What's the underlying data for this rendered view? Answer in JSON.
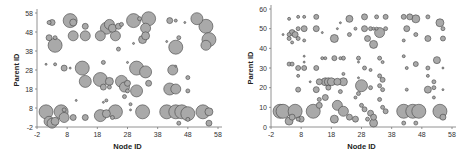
{
  "chart_data": [
    {
      "type": "scatter",
      "title": "",
      "xlabel": "Node ID",
      "ylabel": "Parent ID",
      "xlim": [
        -2,
        58
      ],
      "ylim": [
        -2,
        58
      ],
      "xticks": [
        "-2",
        "8",
        "18",
        "28",
        "38",
        "48",
        "58"
      ],
      "yticks": [
        "-2",
        "8",
        "18",
        "28",
        "38",
        "48",
        "58"
      ],
      "grid": false,
      "legend": null,
      "marker": "bubble",
      "points": [
        {
          "x": 1,
          "y": 6,
          "r": 7
        },
        {
          "x": 2,
          "y": 1,
          "r": 5
        },
        {
          "x": 3,
          "y": 0,
          "r": 5
        },
        {
          "x": 4,
          "y": 1,
          "r": 4
        },
        {
          "x": 6,
          "y": 6,
          "r": 7
        },
        {
          "x": 7,
          "y": 3,
          "r": 5
        },
        {
          "x": 7,
          "y": 7,
          "r": 2
        },
        {
          "x": 2,
          "y": 53,
          "r": 2
        },
        {
          "x": 3,
          "y": 53,
          "r": 3
        },
        {
          "x": 2,
          "y": 45,
          "r": 3
        },
        {
          "x": 4,
          "y": 45,
          "r": 2
        },
        {
          "x": 4,
          "y": 41,
          "r": 7
        },
        {
          "x": 1,
          "y": 31,
          "r": 1
        },
        {
          "x": 4,
          "y": 31,
          "r": 1.5
        },
        {
          "x": 7,
          "y": 29,
          "r": 3
        },
        {
          "x": 9,
          "y": 29,
          "r": 1
        },
        {
          "x": 9,
          "y": 54,
          "r": 7
        },
        {
          "x": 10,
          "y": 53,
          "r": 3.5
        },
        {
          "x": 10,
          "y": 46,
          "r": 5
        },
        {
          "x": 14,
          "y": 46,
          "r": 5
        },
        {
          "x": 14,
          "y": 51,
          "r": 3
        },
        {
          "x": 10,
          "y": 3,
          "r": 3
        },
        {
          "x": 14,
          "y": 3,
          "r": 3
        },
        {
          "x": 11,
          "y": 12,
          "r": 1
        },
        {
          "x": 13,
          "y": 29,
          "r": 7
        },
        {
          "x": 14,
          "y": 22,
          "r": 6
        },
        {
          "x": 19,
          "y": 23,
          "r": 7
        },
        {
          "x": 20,
          "y": 19,
          "r": 3
        },
        {
          "x": 20,
          "y": 32,
          "r": 2
        },
        {
          "x": 22,
          "y": 22,
          "r": 4
        },
        {
          "x": 22,
          "y": 19,
          "r": 2
        },
        {
          "x": 19,
          "y": 4,
          "r": 6
        },
        {
          "x": 21,
          "y": 5,
          "r": 4
        },
        {
          "x": 24,
          "y": 6,
          "r": 7
        },
        {
          "x": 23,
          "y": 3,
          "r": 2
        },
        {
          "x": 20,
          "y": 11,
          "r": 1
        },
        {
          "x": 21,
          "y": 12,
          "r": 1.5
        },
        {
          "x": 19,
          "y": 46,
          "r": 5
        },
        {
          "x": 21,
          "y": 50,
          "r": 6
        },
        {
          "x": 22,
          "y": 52,
          "r": 5
        },
        {
          "x": 23,
          "y": 50,
          "r": 4
        },
        {
          "x": 24,
          "y": 46,
          "r": 5
        },
        {
          "x": 25,
          "y": 51,
          "r": 3
        },
        {
          "x": 26,
          "y": 52,
          "r": 2
        },
        {
          "x": 25,
          "y": 39,
          "r": 2
        },
        {
          "x": 26,
          "y": 22,
          "r": 6
        },
        {
          "x": 27,
          "y": 19,
          "r": 5
        },
        {
          "x": 28,
          "y": 21,
          "r": 3
        },
        {
          "x": 27,
          "y": 14,
          "r": 2
        },
        {
          "x": 28,
          "y": 17,
          "r": 2
        },
        {
          "x": 29,
          "y": 10,
          "r": 1.5
        },
        {
          "x": 28,
          "y": 32,
          "r": 1
        },
        {
          "x": 31,
          "y": 29,
          "r": 7
        },
        {
          "x": 34,
          "y": 27,
          "r": 6
        },
        {
          "x": 31,
          "y": 17,
          "r": 6
        },
        {
          "x": 35,
          "y": 21,
          "r": 3
        },
        {
          "x": 33,
          "y": 6,
          "r": 7
        },
        {
          "x": 29,
          "y": 7,
          "r": 1
        },
        {
          "x": 30,
          "y": 54,
          "r": 7
        },
        {
          "x": 32,
          "y": 55,
          "r": 2
        },
        {
          "x": 34,
          "y": 50,
          "r": 5
        },
        {
          "x": 35,
          "y": 55,
          "r": 7
        },
        {
          "x": 33,
          "y": 44,
          "r": 4
        },
        {
          "x": 34,
          "y": 46,
          "r": 4
        },
        {
          "x": 30,
          "y": 42,
          "r": 1
        },
        {
          "x": 42,
          "y": 54,
          "r": 3
        },
        {
          "x": 44,
          "y": 54,
          "r": 1.5
        },
        {
          "x": 41,
          "y": 43,
          "r": 1
        },
        {
          "x": 44,
          "y": 40,
          "r": 7
        },
        {
          "x": 45,
          "y": 45,
          "r": 2
        },
        {
          "x": 47,
          "y": 53,
          "r": 1
        },
        {
          "x": 43,
          "y": 28,
          "r": 5
        },
        {
          "x": 44,
          "y": 30,
          "r": 1
        },
        {
          "x": 42,
          "y": 18,
          "r": 6
        },
        {
          "x": 44,
          "y": 18,
          "r": 5
        },
        {
          "x": 48,
          "y": 24,
          "r": 2
        },
        {
          "x": 48,
          "y": 17,
          "r": 2
        },
        {
          "x": 41,
          "y": 6,
          "r": 7
        },
        {
          "x": 44,
          "y": 6,
          "r": 7
        },
        {
          "x": 46,
          "y": 6,
          "r": 7
        },
        {
          "x": 48,
          "y": 5,
          "r": 7
        },
        {
          "x": 45,
          "y": 0,
          "r": 2
        },
        {
          "x": 48,
          "y": 2,
          "r": 2
        },
        {
          "x": 51,
          "y": 55,
          "r": 6
        },
        {
          "x": 54,
          "y": 51,
          "r": 7
        },
        {
          "x": 55,
          "y": 44,
          "r": 7
        },
        {
          "x": 54,
          "y": 41,
          "r": 5
        },
        {
          "x": 53,
          "y": 6,
          "r": 7
        },
        {
          "x": 55,
          "y": 6,
          "r": 4
        },
        {
          "x": 55,
          "y": 0,
          "r": 3
        }
      ]
    },
    {
      "type": "scatter",
      "title": "",
      "xlabel": "Node ID",
      "ylabel": "Parent ID",
      "xlim": [
        -2,
        58
      ],
      "ylim": [
        0,
        60
      ],
      "xticks": [
        "-2",
        "8",
        "18",
        "28",
        "38",
        "48",
        "58"
      ],
      "yticks": [
        "0",
        "10",
        "20",
        "30",
        "40",
        "50",
        "60"
      ],
      "grid": false,
      "legend": null,
      "marker": "bubble",
      "points": [
        {
          "x": 1,
          "y": 8,
          "r": 7
        },
        {
          "x": 2,
          "y": 8,
          "r": 7
        },
        {
          "x": 4,
          "y": 3,
          "r": 4
        },
        {
          "x": 5,
          "y": 5,
          "r": 3
        },
        {
          "x": 6,
          "y": 8,
          "r": 7
        },
        {
          "x": 8,
          "y": 4,
          "r": 3
        },
        {
          "x": 12,
          "y": 8,
          "r": 7
        },
        {
          "x": 7,
          "y": 4,
          "r": 2
        },
        {
          "x": 4,
          "y": 55,
          "r": 1.5
        },
        {
          "x": 7,
          "y": 56,
          "r": 1.5
        },
        {
          "x": 9,
          "y": 56,
          "r": 1.5
        },
        {
          "x": 2,
          "y": 47,
          "r": 1
        },
        {
          "x": 4,
          "y": 47,
          "r": 2
        },
        {
          "x": 5,
          "y": 48,
          "r": 3
        },
        {
          "x": 6,
          "y": 47,
          "r": 3
        },
        {
          "x": 4,
          "y": 45,
          "r": 2
        },
        {
          "x": 5,
          "y": 43,
          "r": 1.5
        },
        {
          "x": 7,
          "y": 50,
          "r": 2
        },
        {
          "x": 9,
          "y": 50,
          "r": 3
        },
        {
          "x": 7,
          "y": 45,
          "r": 2
        },
        {
          "x": 9,
          "y": 44,
          "r": 1.5
        },
        {
          "x": 4,
          "y": 32,
          "r": 2
        },
        {
          "x": 5,
          "y": 32,
          "r": 2
        },
        {
          "x": 7,
          "y": 30,
          "r": 2.5
        },
        {
          "x": 9,
          "y": 30,
          "r": 2.5
        },
        {
          "x": 9,
          "y": 36,
          "r": 1
        },
        {
          "x": 9,
          "y": 33,
          "r": 1
        },
        {
          "x": 7,
          "y": 26,
          "r": 1.5
        },
        {
          "x": 7,
          "y": 19,
          "r": 2.5
        },
        {
          "x": 11,
          "y": 23,
          "r": 1
        },
        {
          "x": 13,
          "y": 56,
          "r": 2.5
        },
        {
          "x": 13,
          "y": 50,
          "r": 3
        },
        {
          "x": 15,
          "y": 48,
          "r": 1
        },
        {
          "x": 13,
          "y": 30,
          "r": 2.5
        },
        {
          "x": 14,
          "y": 23,
          "r": 3
        },
        {
          "x": 13,
          "y": 19,
          "r": 3
        },
        {
          "x": 14,
          "y": 14,
          "r": 2
        },
        {
          "x": 14,
          "y": 11,
          "r": 3
        },
        {
          "x": 15,
          "y": 35,
          "r": 1.5
        },
        {
          "x": 16,
          "y": 35,
          "r": 1.5
        },
        {
          "x": 16,
          "y": 23,
          "r": 4
        },
        {
          "x": 17,
          "y": 23,
          "r": 4
        },
        {
          "x": 18,
          "y": 23,
          "r": 4
        },
        {
          "x": 16,
          "y": 15,
          "r": 3
        },
        {
          "x": 17,
          "y": 20,
          "r": 2.5
        },
        {
          "x": 19,
          "y": 45,
          "r": 4
        },
        {
          "x": 19,
          "y": 35,
          "r": 2.5
        },
        {
          "x": 20,
          "y": 50,
          "r": 1
        },
        {
          "x": 21,
          "y": 53,
          "r": 1
        },
        {
          "x": 21,
          "y": 35,
          "r": 1.5
        },
        {
          "x": 22,
          "y": 35,
          "r": 2
        },
        {
          "x": 20,
          "y": 23,
          "r": 3.5
        },
        {
          "x": 22,
          "y": 23,
          "r": 4
        },
        {
          "x": 21,
          "y": 18,
          "r": 2
        },
        {
          "x": 20,
          "y": 11,
          "r": 5
        },
        {
          "x": 22,
          "y": 8,
          "r": 5
        },
        {
          "x": 19,
          "y": 4,
          "r": 4
        },
        {
          "x": 22,
          "y": 27,
          "r": 1.5
        },
        {
          "x": 24,
          "y": 55,
          "r": 3.5
        },
        {
          "x": 24,
          "y": 47,
          "r": 2
        },
        {
          "x": 24,
          "y": 5,
          "r": 3
        },
        {
          "x": 26,
          "y": 50,
          "r": 1.5
        },
        {
          "x": 27,
          "y": 35,
          "r": 2
        },
        {
          "x": 27,
          "y": 33,
          "r": 1
        },
        {
          "x": 27,
          "y": 25,
          "r": 1
        },
        {
          "x": 28,
          "y": 21,
          "r": 6
        },
        {
          "x": 27,
          "y": 17,
          "r": 2
        },
        {
          "x": 26,
          "y": 15,
          "r": 1.5
        },
        {
          "x": 28,
          "y": 11,
          "r": 2
        },
        {
          "x": 26,
          "y": 4,
          "r": 3
        },
        {
          "x": 29,
          "y": 56,
          "r": 3
        },
        {
          "x": 29,
          "y": 50,
          "r": 3
        },
        {
          "x": 31,
          "y": 50,
          "r": 2
        },
        {
          "x": 32,
          "y": 50,
          "r": 1.5
        },
        {
          "x": 30,
          "y": 45,
          "r": 3
        },
        {
          "x": 32,
          "y": 42,
          "r": 4
        },
        {
          "x": 29,
          "y": 30,
          "r": 2
        },
        {
          "x": 31,
          "y": 29,
          "r": 1.5
        },
        {
          "x": 31,
          "y": 20,
          "r": 2
        },
        {
          "x": 29,
          "y": 9,
          "r": 2.5
        },
        {
          "x": 31,
          "y": 7,
          "r": 3
        },
        {
          "x": 32,
          "y": 5,
          "r": 3
        },
        {
          "x": 32,
          "y": 2,
          "r": 4
        },
        {
          "x": 30,
          "y": 4,
          "r": 2
        },
        {
          "x": 33,
          "y": 56,
          "r": 2
        },
        {
          "x": 33,
          "y": 50,
          "r": 1.5
        },
        {
          "x": 34,
          "y": 48,
          "r": 5
        },
        {
          "x": 36,
          "y": 50,
          "r": 2
        },
        {
          "x": 36,
          "y": 56,
          "r": 2.5
        },
        {
          "x": 34,
          "y": 35,
          "r": 2
        },
        {
          "x": 35,
          "y": 33,
          "r": 1.5
        },
        {
          "x": 34,
          "y": 26,
          "r": 2
        },
        {
          "x": 35,
          "y": 24,
          "r": 2.5
        },
        {
          "x": 34,
          "y": 21,
          "r": 2
        },
        {
          "x": 35,
          "y": 19,
          "r": 2
        },
        {
          "x": 34,
          "y": 14,
          "r": 2
        },
        {
          "x": 35,
          "y": 10,
          "r": 2
        },
        {
          "x": 36,
          "y": 8,
          "r": 2.5
        },
        {
          "x": 42,
          "y": 56,
          "r": 2.5
        },
        {
          "x": 43,
          "y": 50,
          "r": 3
        },
        {
          "x": 42,
          "y": 44,
          "r": 1.5
        },
        {
          "x": 42,
          "y": 36,
          "r": 1.5
        },
        {
          "x": 43,
          "y": 30,
          "r": 1.5
        },
        {
          "x": 43,
          "y": 19,
          "r": 1.5
        },
        {
          "x": 42,
          "y": 8,
          "r": 7
        },
        {
          "x": 42,
          "y": 2,
          "r": 2
        },
        {
          "x": 44,
          "y": 56,
          "r": 3
        },
        {
          "x": 46,
          "y": 55,
          "r": 4
        },
        {
          "x": 45,
          "y": 8,
          "r": 7
        },
        {
          "x": 47,
          "y": 8,
          "r": 7
        },
        {
          "x": 46,
          "y": 2,
          "r": 2
        },
        {
          "x": 46,
          "y": 32,
          "r": 2.5
        },
        {
          "x": 46,
          "y": 47,
          "r": 2
        },
        {
          "x": 50,
          "y": 56,
          "r": 2
        },
        {
          "x": 50,
          "y": 45,
          "r": 3
        },
        {
          "x": 50,
          "y": 30,
          "r": 2
        },
        {
          "x": 50,
          "y": 26,
          "r": 1.5
        },
        {
          "x": 50,
          "y": 19,
          "r": 3.5
        },
        {
          "x": 52,
          "y": 23,
          "r": 2
        },
        {
          "x": 52,
          "y": 20,
          "r": 2
        },
        {
          "x": 52,
          "y": 15,
          "r": 1.5
        },
        {
          "x": 53,
          "y": 34,
          "r": 3.5
        },
        {
          "x": 54,
          "y": 53,
          "r": 4
        },
        {
          "x": 55,
          "y": 50,
          "r": 2
        },
        {
          "x": 55,
          "y": 45,
          "r": 2.5
        },
        {
          "x": 55,
          "y": 30,
          "r": 1
        },
        {
          "x": 55,
          "y": 19,
          "r": 1
        },
        {
          "x": 54,
          "y": 8,
          "r": 7
        },
        {
          "x": 55,
          "y": 5,
          "r": 3
        }
      ]
    }
  ]
}
